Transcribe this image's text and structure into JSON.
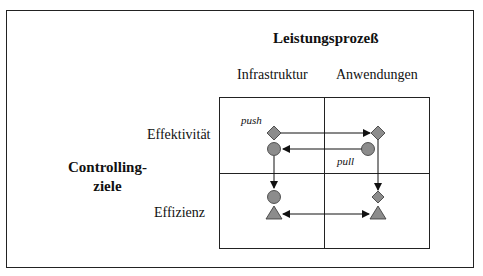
{
  "title": "Leistungsprozeß",
  "columns": [
    "Infrastruktur",
    "Anwendungen"
  ],
  "rows": [
    "Effektivität",
    "Effizienz"
  ],
  "side_label": {
    "line1": "Controlling-",
    "line2": "ziele"
  },
  "arrow_labels": {
    "push": "push",
    "pull": "pull"
  },
  "colors": {
    "shape_fill": "#8c8c8c",
    "line": "#222222",
    "background": "#ffffff"
  },
  "legend_shapes": {
    "diamond": "effectiveness objective",
    "circle": "intermediate objective",
    "triangle": "efficiency objective"
  },
  "flows": [
    {
      "from": "Infrastruktur/Effektivität diamond",
      "to": "Anwendungen/Effektivität diamond",
      "label": "push"
    },
    {
      "from": "Anwendungen/Effektivität circle",
      "to": "Infrastruktur/Effektivität circle",
      "label": "pull"
    },
    {
      "from": "Infrastruktur/Effektivität circle",
      "to": "Infrastruktur/Effizienz circle"
    },
    {
      "from": "Anwendungen/Effektivität diamond",
      "to": "Anwendungen/Effizienz diamond"
    },
    {
      "from": "Infrastruktur/Effizienz triangle",
      "to": "Anwendungen/Effizienz triangle",
      "bidirectional": true
    }
  ]
}
